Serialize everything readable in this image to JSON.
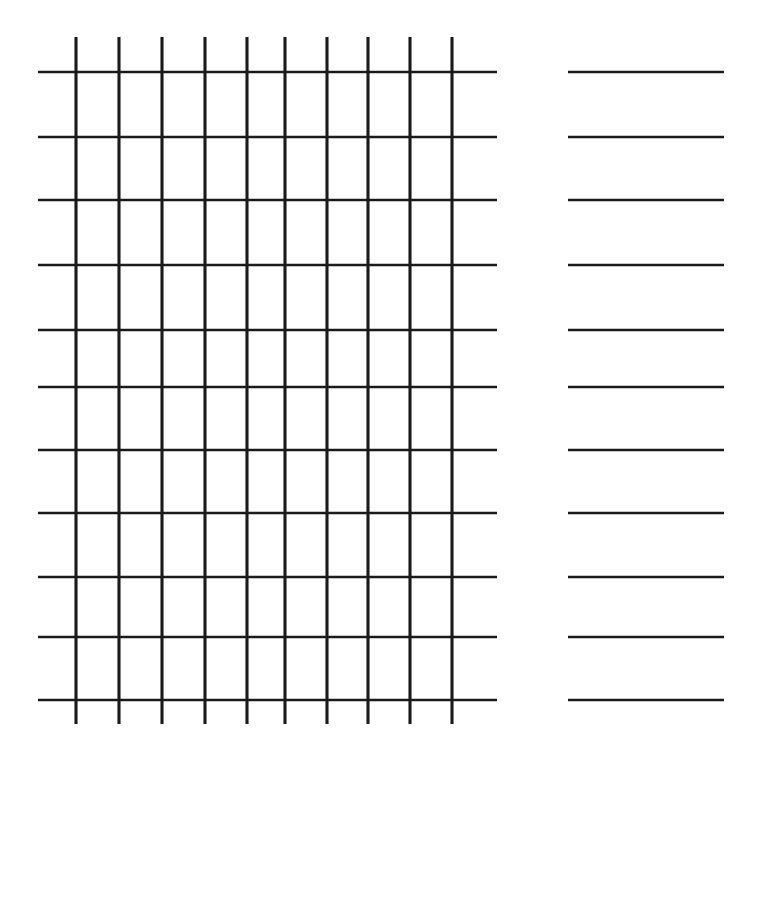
{
  "diagram": {
    "type": "programmable-logic-array",
    "ink_color": "#1a1a1a",
    "background_color": "#ffffff"
  },
  "geometry": {
    "width": 761,
    "height": 908,
    "and_columns_x": [
      76,
      119,
      162,
      205,
      247,
      285,
      327,
      368,
      410,
      452
    ],
    "or_columns_x": [
      604,
      686
    ],
    "rows_y": [
      72,
      137,
      200,
      265,
      330,
      387,
      450,
      513,
      577,
      637,
      700
    ],
    "grid_top_y": 37,
    "grid_bottom_y": 724,
    "row_line_left_x": 38,
    "row_line_right_x": 724,
    "and_gate_left_x": 497,
    "and_gate_right_x": 568,
    "gate_half_height": 24
  },
  "and_plane": {
    "label": "AND plane",
    "product_terms": [
      {
        "name": "a",
        "row": 0,
        "label": "a",
        "connections_x": [
          76,
          247,
          452
        ]
      },
      {
        "name": "b",
        "row": 1,
        "label": "b",
        "connections_x": [
          76,
          285,
          410
        ]
      },
      {
        "name": "c",
        "row": 2,
        "label": "c",
        "connections_x": [
          119,
          247,
          410
        ]
      },
      {
        "name": "d",
        "row": 3,
        "label": "d",
        "connections_x": [
          119,
          285,
          452
        ]
      },
      {
        "name": "e",
        "row": 4,
        "label": "",
        "connections_x": [
          285,
          368,
          452
        ]
      },
      {
        "name": "f",
        "row": 5,
        "label": "",
        "connections_x": [
          205,
          368,
          452
        ]
      },
      {
        "name": "g",
        "row": 6,
        "label": "",
        "connections_x": [
          119,
          410,
          452
        ]
      },
      {
        "name": "h",
        "row": 7,
        "label": "",
        "connections_x": [
          119,
          368,
          410
        ]
      },
      {
        "name": "i",
        "row": 8,
        "label": "",
        "connections_x": [
          119,
          205,
          452
        ]
      },
      {
        "name": "j",
        "row": 9,
        "label": "",
        "connections_x": [
          119,
          205,
          368
        ]
      },
      {
        "name": "k",
        "row": 10,
        "label": "",
        "connections_x": [
          205,
          410
        ]
      }
    ]
  },
  "or_plane": {
    "label": "OR plane",
    "output_columns": [
      {
        "name": "S0",
        "x": 604,
        "connected_rows": [
          0,
          1,
          2,
          3
        ]
      },
      {
        "name": "Cout",
        "x": 686,
        "connected_rows": [
          4,
          5,
          6,
          7,
          8,
          9,
          10
        ]
      }
    ]
  },
  "inputs": [
    {
      "label": "C",
      "sub": "in",
      "input_x": 119,
      "inverter_x": 76,
      "label_x": 119
    },
    {
      "label": "A",
      "sub": "1",
      "input_x": 205,
      "inverter_x": 162,
      "label_x": 205
    },
    {
      "label": "A",
      "sub": "0",
      "input_x": 285,
      "inverter_x": 247,
      "label_x": 285
    },
    {
      "label": "B",
      "sub": "1",
      "input_x": 368,
      "inverter_x": 327,
      "label_x": 368
    },
    {
      "label": "B",
      "sub": "0",
      "input_x": 452,
      "inverter_x": 410,
      "label_x": 452
    }
  ],
  "outputs": [
    {
      "label": "S",
      "sub": "0",
      "x": 604
    },
    {
      "label": "C",
      "sub": "out",
      "x": 686
    }
  ],
  "inverter": {
    "symbol": "NOT-gate",
    "top_y": 724,
    "tri_top_y": 738,
    "tri_bottom_y": 772,
    "tri_half_width": 26,
    "bubble_cy": 780,
    "bubble_r": 8,
    "tap_y": 808,
    "label_y": 858
  },
  "or_gate": {
    "symbol": "OR-gate",
    "top_y": 724,
    "body_top_y": 758,
    "body_bottom_y": 812,
    "half_width": 27,
    "stem_bottom_y": 840,
    "label_y": 876
  }
}
